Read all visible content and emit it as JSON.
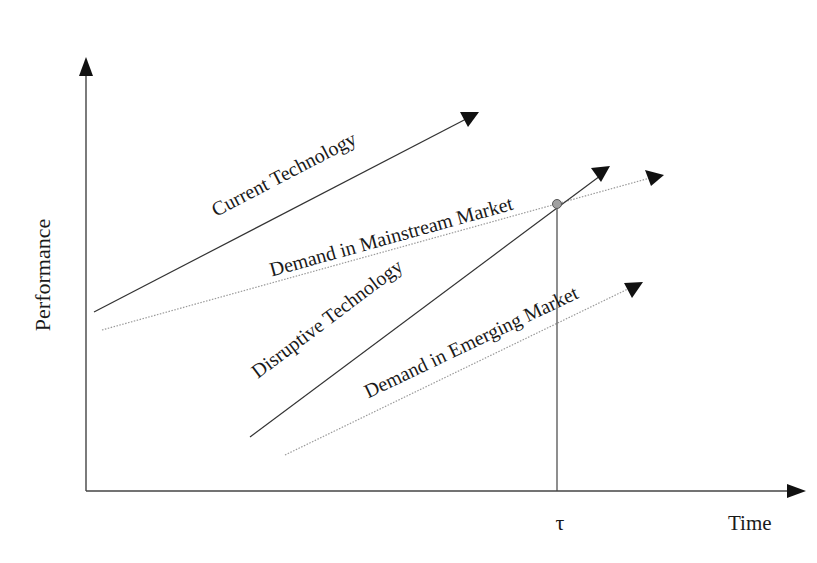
{
  "diagram": {
    "axes": {
      "y_label": "Performance",
      "x_label": "Time",
      "x_marker": "τ"
    },
    "lines": [
      {
        "id": "current-technology",
        "label": "Current Technology",
        "style": "solid",
        "color": "#333333"
      },
      {
        "id": "demand-mainstream",
        "label": "Demand in Mainstream Market",
        "style": "dotted",
        "color": "#9a9a9a"
      },
      {
        "id": "disruptive-technology",
        "label": "Disruptive Technology",
        "style": "solid",
        "color": "#333333"
      },
      {
        "id": "demand-emerging",
        "label": "Demand in Emerging Market",
        "style": "dotted",
        "color": "#9a9a9a"
      }
    ],
    "intersection": {
      "label": "τ",
      "description": "Disruptive Technology meets Demand in Mainstream Market",
      "color": "#a0a0a0"
    }
  }
}
